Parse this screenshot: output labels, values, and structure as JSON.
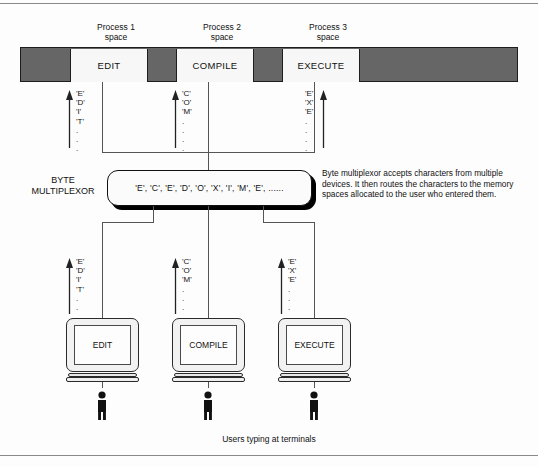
{
  "diagram": {
    "title_rules": {
      "top": true,
      "bottom": true
    },
    "process_headers": [
      {
        "label": "Process 1\nspace"
      },
      {
        "label": "Process 2\nspace"
      },
      {
        "label": "Process 3\nspace"
      }
    ],
    "memory_bar": {
      "background_color": "#666666",
      "slots": [
        {
          "label": "EDIT"
        },
        {
          "label": "COMPILE"
        },
        {
          "label": "EXECUTE"
        }
      ]
    },
    "upper_streams": [
      {
        "chars": "'E'\n'D'\n'I'\n'T'\n.\n.\n.",
        "arrow_side": "left"
      },
      {
        "chars": "'C'\n'O'\n'M'\n.\n.\n.\n.",
        "arrow_side": "left"
      },
      {
        "chars": "'E'\n'X'\n'E'\n.\n.\n.\n.",
        "arrow_side": "right"
      }
    ],
    "lower_streams": [
      {
        "chars": "'E'\n'D'\n'I'\n'T'\n.\n.\n.",
        "arrow_side": "left"
      },
      {
        "chars": "'C'\n'O'\n'M'\n.\n.\n.\n.",
        "arrow_side": "left"
      },
      {
        "chars": "'E'\n'X'\n'E'\n.\n.\n.\n.",
        "arrow_side": "left"
      }
    ],
    "multiplexor": {
      "label": "BYTE\nMULTIPLEXOR",
      "stream": "'E', 'C', 'E', 'D', 'O', 'X', 'I', 'M', 'E', ......",
      "description": "Byte multiplexor accepts characters from multiple devices.  It then routes the characters to the memory spaces allocated to the user who entered them."
    },
    "terminals": [
      {
        "screen_label": "EDIT"
      },
      {
        "screen_label": "COMPILE"
      },
      {
        "screen_label": "EXECUTE"
      }
    ],
    "caption": "Users typing at terminals"
  }
}
